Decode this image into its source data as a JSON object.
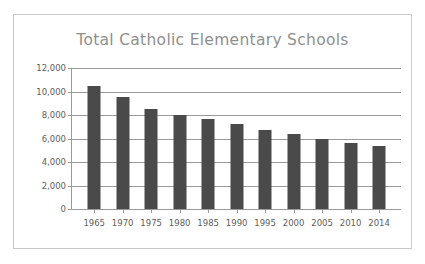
{
  "chart_data": {
    "type": "bar",
    "title": "Total Catholic Elementary Schools",
    "xlabel": "",
    "ylabel": "",
    "categories": [
      "1965",
      "1970",
      "1975",
      "1980",
      "1985",
      "1990",
      "1995",
      "2000",
      "2005",
      "2010",
      "2014"
    ],
    "values": [
      10500,
      9500,
      8500,
      8000,
      7650,
      7250,
      6750,
      6400,
      6000,
      5650,
      5350
    ],
    "ylim": [
      0,
      12000
    ],
    "yticks": [
      0,
      2000,
      4000,
      6000,
      8000,
      10000,
      12000
    ],
    "ytick_labels": [
      "0",
      "2,000",
      "4,000",
      "6,000",
      "8,000",
      "10,000",
      "12,000"
    ],
    "grid": true,
    "legend": false,
    "bar_color": "#4a4a4a",
    "grid_color": "#9a9a9a",
    "title_color": "#8f8f8f",
    "tick_label_color": "#5e5e5e",
    "frame_color": "#c9c9c9",
    "background": "#ffffff"
  }
}
